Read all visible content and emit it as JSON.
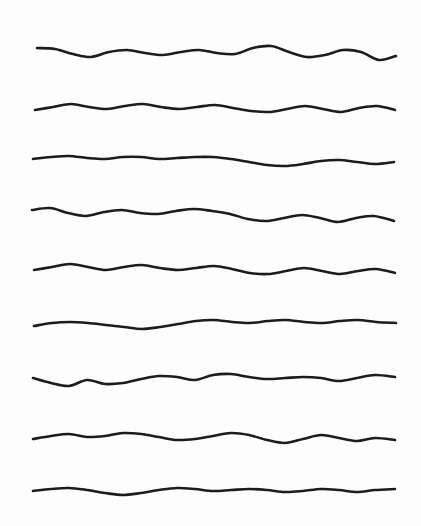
{
  "canvas": {
    "width": 421,
    "height": 526,
    "background_color": "#fdfdfd",
    "description": "Nine hand-drawn horizontal wavy lines stacked vertically on a plain white page"
  },
  "style": {
    "stroke_color": "#1c1c1c",
    "stroke_width": 2.6,
    "stroke_linecap": "round",
    "stroke_linejoin": "round",
    "fill": "none"
  },
  "chart_data": {
    "type": "line",
    "title": "",
    "subtitle": "",
    "xlabel": "",
    "ylabel": "",
    "grid": false,
    "legend_position": "none",
    "xlim": [
      0,
      421
    ],
    "ylim": [
      0,
      526
    ],
    "x_sample_step": 17.9,
    "series": [
      {
        "name": "wave-1",
        "baseline_y": 52,
        "x_start": 37,
        "x_end": 396,
        "x": [
          37,
          55,
          73,
          91,
          109,
          127,
          145,
          163,
          181,
          199,
          217,
          235,
          253,
          271,
          289,
          307,
          325,
          343,
          361,
          379,
          396
        ],
        "values": [
          48,
          49,
          54,
          57,
          52,
          50,
          53,
          55,
          52,
          50,
          53,
          54,
          48,
          46,
          52,
          57,
          55,
          50,
          52,
          60,
          56
        ]
      },
      {
        "name": "wave-2",
        "baseline_y": 108,
        "x_start": 35,
        "x_end": 395,
        "x": [
          35,
          53,
          71,
          89,
          107,
          125,
          143,
          161,
          179,
          197,
          215,
          233,
          251,
          269,
          287,
          305,
          323,
          341,
          359,
          377,
          395
        ],
        "values": [
          110,
          107,
          104,
          107,
          109,
          106,
          104,
          107,
          109,
          107,
          105,
          108,
          111,
          112,
          109,
          106,
          109,
          112,
          108,
          106,
          110
        ]
      },
      {
        "name": "wave-3",
        "baseline_y": 160,
        "x_start": 33,
        "x_end": 394,
        "x": [
          33,
          51,
          69,
          87,
          105,
          123,
          141,
          159,
          177,
          195,
          213,
          231,
          249,
          267,
          285,
          303,
          321,
          339,
          357,
          375,
          394
        ],
        "values": [
          159,
          157,
          156,
          158,
          159,
          157,
          157,
          159,
          158,
          157,
          157,
          159,
          162,
          165,
          166,
          164,
          161,
          160,
          162,
          164,
          162
        ]
      },
      {
        "name": "wave-4",
        "baseline_y": 213,
        "x_start": 32,
        "x_end": 394,
        "x": [
          32,
          50,
          68,
          86,
          104,
          122,
          140,
          158,
          176,
          194,
          212,
          230,
          248,
          266,
          284,
          302,
          320,
          338,
          356,
          374,
          394
        ],
        "values": [
          210,
          208,
          213,
          216,
          212,
          210,
          213,
          214,
          211,
          209,
          211,
          214,
          219,
          221,
          218,
          215,
          218,
          222,
          218,
          216,
          221
        ]
      },
      {
        "name": "wave-5",
        "baseline_y": 268,
        "x_start": 34,
        "x_end": 395,
        "x": [
          34,
          52,
          70,
          88,
          106,
          124,
          142,
          160,
          178,
          196,
          214,
          232,
          250,
          268,
          286,
          304,
          322,
          340,
          358,
          376,
          395
        ],
        "values": [
          270,
          267,
          264,
          267,
          270,
          267,
          265,
          268,
          270,
          268,
          266,
          269,
          273,
          274,
          271,
          268,
          271,
          274,
          271,
          269,
          273
        ]
      },
      {
        "name": "wave-6",
        "baseline_y": 323,
        "x_start": 34,
        "x_end": 396,
        "x": [
          34,
          52,
          70,
          88,
          106,
          124,
          142,
          160,
          178,
          196,
          214,
          232,
          250,
          268,
          286,
          304,
          322,
          340,
          358,
          376,
          396
        ],
        "values": [
          326,
          323,
          322,
          323,
          325,
          327,
          329,
          327,
          324,
          321,
          320,
          322,
          323,
          321,
          320,
          322,
          323,
          321,
          320,
          322,
          323
        ]
      },
      {
        "name": "wave-7",
        "baseline_y": 378,
        "x_start": 33,
        "x_end": 395,
        "x": [
          33,
          51,
          69,
          87,
          105,
          123,
          141,
          159,
          177,
          195,
          213,
          231,
          249,
          267,
          285,
          303,
          321,
          339,
          357,
          375,
          395
        ],
        "values": [
          378,
          383,
          386,
          380,
          384,
          383,
          379,
          376,
          377,
          380,
          375,
          374,
          377,
          379,
          378,
          377,
          378,
          381,
          378,
          375,
          377
        ]
      },
      {
        "name": "wave-8",
        "baseline_y": 436,
        "x_start": 33,
        "x_end": 395,
        "x": [
          33,
          51,
          69,
          87,
          105,
          123,
          141,
          159,
          177,
          195,
          213,
          231,
          249,
          267,
          285,
          303,
          321,
          339,
          357,
          375,
          395
        ],
        "values": [
          439,
          436,
          434,
          437,
          436,
          433,
          434,
          437,
          440,
          439,
          436,
          433,
          435,
          440,
          443,
          439,
          435,
          438,
          441,
          438,
          440
        ]
      },
      {
        "name": "wave-9",
        "baseline_y": 490,
        "x_start": 33,
        "x_end": 395,
        "x": [
          33,
          51,
          69,
          87,
          105,
          123,
          141,
          159,
          177,
          195,
          213,
          231,
          249,
          267,
          285,
          303,
          321,
          339,
          357,
          375,
          395
        ],
        "values": [
          491,
          489,
          488,
          490,
          493,
          495,
          493,
          490,
          488,
          489,
          491,
          490,
          489,
          490,
          492,
          491,
          489,
          490,
          492,
          490,
          489
        ]
      }
    ]
  }
}
